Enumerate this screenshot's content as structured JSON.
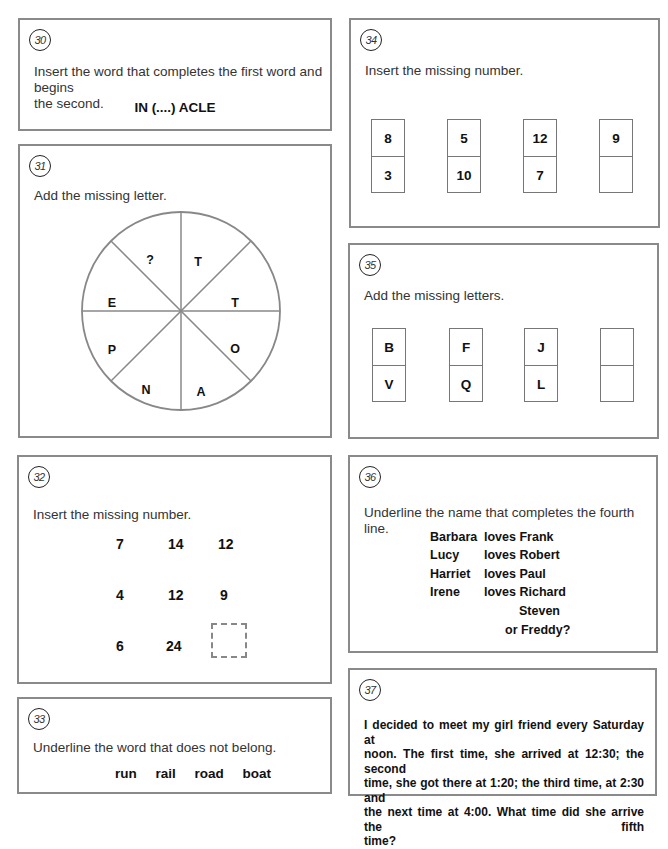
{
  "puzzles": {
    "p30": {
      "number": "30",
      "prompt_line1": "Insert the word that completes the first word and begins",
      "prompt_line2": "the second.",
      "puzzle": "IN (....) ACLE"
    },
    "p31": {
      "number": "31",
      "prompt": "Add the missing letter.",
      "segments": [
        "?",
        "T",
        "T",
        "O",
        "A",
        "N",
        "P",
        "E"
      ]
    },
    "p32": {
      "number": "32",
      "prompt": "Insert the missing number.",
      "grid": [
        [
          "7",
          "14",
          "12"
        ],
        [
          "4",
          "12",
          "9"
        ],
        [
          "6",
          "24",
          ""
        ]
      ]
    },
    "p33": {
      "number": "33",
      "prompt": "Underline the word that does not belong.",
      "words": [
        "run",
        "rail",
        "road",
        "boat"
      ]
    },
    "p34": {
      "number": "34",
      "prompt": "Insert the missing number.",
      "dominoes": [
        {
          "top": "8",
          "bottom": "3"
        },
        {
          "top": "5",
          "bottom": "10"
        },
        {
          "top": "12",
          "bottom": "7"
        },
        {
          "top": "9",
          "bottom": ""
        }
      ]
    },
    "p35": {
      "number": "35",
      "prompt": "Add the missing letters.",
      "dominoes": [
        {
          "top": "B",
          "bottom": "V"
        },
        {
          "top": "F",
          "bottom": "Q"
        },
        {
          "top": "J",
          "bottom": "L"
        },
        {
          "top": "",
          "bottom": ""
        }
      ]
    },
    "p36": {
      "number": "36",
      "prompt": "Underline the name that completes the fourth line.",
      "lines": [
        {
          "name": "Barbara",
          "loves": "loves Frank"
        },
        {
          "name": "Lucy",
          "loves": "loves Robert"
        },
        {
          "name": "Harriet",
          "loves": "loves Paul"
        },
        {
          "name": "Irene",
          "loves": "loves Richard"
        }
      ],
      "option1": "Steven",
      "option2": "or Freddy?"
    },
    "p37": {
      "number": "37",
      "lines": [
        "I decided to meet my girl friend every Saturday at",
        "noon. The first time, she arrived at 12:30; the second",
        "time, she got there at 1:20; the third time, at 2:30 and",
        "the next time at 4:00. What time did she arrive the fifth",
        "time?"
      ]
    }
  }
}
